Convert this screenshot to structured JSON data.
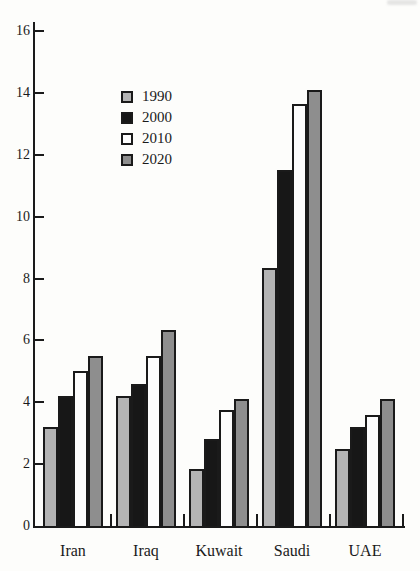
{
  "figure": {
    "kind": "scanned-book-bar-chart",
    "background_color": "#fdfdfb",
    "axis_color": "#1a1a1a",
    "bar_outline_color": "#1a1a1a"
  },
  "chart_data": {
    "type": "bar",
    "grouped": true,
    "title": "",
    "xlabel": "",
    "ylabel": "",
    "categories": [
      "Iran",
      "Iraq",
      "Kuwait",
      "Saudi",
      "UAE"
    ],
    "series": [
      {
        "name": "1990",
        "color": "#b4b4b4",
        "values": [
          3.2,
          4.2,
          1.85,
          8.35,
          2.5
        ]
      },
      {
        "name": "2000",
        "color": "#171717",
        "values": [
          4.2,
          4.6,
          2.8,
          11.5,
          3.2
        ]
      },
      {
        "name": "2010",
        "color": "#fdfdfd",
        "values": [
          5.0,
          5.5,
          3.75,
          13.65,
          3.6
        ]
      },
      {
        "name": "2020",
        "color": "#8e8e8e",
        "values": [
          5.5,
          6.35,
          4.1,
          14.1,
          4.1
        ]
      }
    ],
    "ylim": [
      0,
      16
    ],
    "ytick_step": 2,
    "ytick_labels": [
      "0",
      "2",
      "4",
      "6",
      "8",
      "10",
      "12",
      "14",
      "16"
    ],
    "grid": false,
    "legend_position": "upper-left-inside",
    "legend_labels": [
      "1990",
      "2000",
      "2010",
      "2020"
    ]
  }
}
